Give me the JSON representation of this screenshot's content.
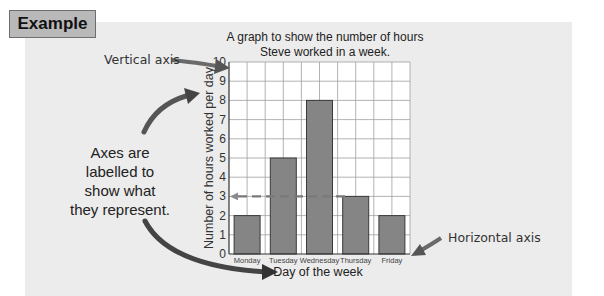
{
  "example_label": "Example",
  "chart_title_line1": "A graph to show the number of hours",
  "chart_title_line2": "Steve worked in a week.",
  "annotations": {
    "vertical_axis": "Vertical axis",
    "horizontal_axis": "Horizontal axis",
    "axes_note_line1": "Axes are",
    "axes_note_line2": "labelled to",
    "axes_note_line3": "show what",
    "axes_note_line4": "they represent."
  },
  "xlabel": "Day of the week",
  "ylabel": "Number of hours worked per day",
  "y_ticks": [
    "0",
    "1",
    "2",
    "3",
    "4",
    "5",
    "6",
    "7",
    "8",
    "9",
    "10"
  ],
  "categories": [
    "Monday",
    "Tuesday",
    "Wednesday",
    "Thursday",
    "Friday"
  ],
  "colors": {
    "bar": "#858585",
    "bar_border": "#3a3a3a",
    "grid": "#9a9a9a",
    "arrow": "#555555",
    "panel": "#ececec",
    "tag": "#b9b9b9"
  },
  "chart_data": {
    "type": "bar",
    "title": "A graph to show the number of hours Steve worked in a week.",
    "categories": [
      "Monday",
      "Tuesday",
      "Wednesday",
      "Thursday",
      "Friday"
    ],
    "values": [
      2,
      5,
      8,
      3,
      2
    ],
    "xlabel": "Day of the week",
    "ylabel": "Number of hours worked per day",
    "ylim": [
      0,
      10
    ],
    "yticks": [
      0,
      1,
      2,
      3,
      4,
      5,
      6,
      7,
      8,
      9,
      10
    ],
    "grid": true,
    "legend": null,
    "annotations": [
      "Vertical axis (arrow to y-axis)",
      "Horizontal axis (arrow to x-axis)",
      "Axes are labelled to show what they represent.",
      "Dashed arrow from Thursday bar top (3) to y-axis value 3"
    ]
  }
}
